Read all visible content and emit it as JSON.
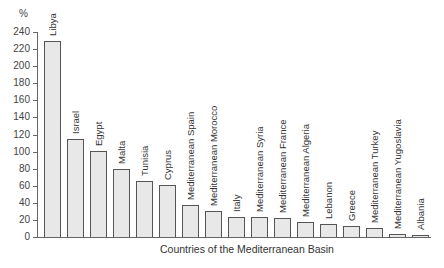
{
  "chart_data": {
    "type": "bar",
    "title": "",
    "xlabel": "Countries of the Mediterranean Basin",
    "ylabel": "%",
    "ylim": [
      0,
      240
    ],
    "yticks": [
      0,
      20,
      40,
      60,
      80,
      100,
      120,
      140,
      160,
      180,
      200,
      220,
      240
    ],
    "grid": false,
    "legend": null,
    "categories": [
      "Libya",
      "Israel",
      "Egypt",
      "Malta",
      "Tunisia",
      "Cyprus",
      "Mediterranean Spain",
      "Mediterranean Morocco",
      "Italy",
      "Mediterranean Syria",
      "Mediterranean France",
      "Mediterranean Algeria",
      "Lebanon",
      "Greece",
      "Mediterranean Turkey",
      "Mediterranean Yugoslavia",
      "Albania"
    ],
    "values": [
      229,
      115,
      101,
      80,
      65,
      61,
      37,
      30,
      24,
      23,
      22,
      17,
      15,
      13,
      11,
      4,
      2
    ],
    "bar_color": "#e8e8e8",
    "edge_color": "#555555"
  }
}
